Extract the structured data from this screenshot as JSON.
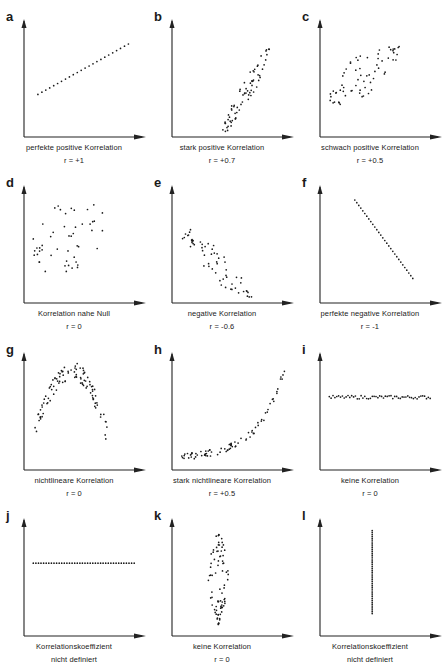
{
  "chart_data": [
    {
      "panel": "a",
      "type": "scatter",
      "title": "perfekte positive Korrelation",
      "r_label": "r = +1",
      "pattern": "line",
      "points": [
        [
          0.12,
          0.38
        ],
        [
          0.9,
          0.83
        ]
      ],
      "n": 24
    },
    {
      "panel": "b",
      "type": "scatter",
      "title": "stark positive Korrelation",
      "r_label": "r = +0.7",
      "pattern": "narrow-band",
      "from": [
        0.45,
        0.05
      ],
      "to": [
        0.85,
        0.82
      ],
      "width": 0.07,
      "n": 70
    },
    {
      "panel": "c",
      "type": "scatter",
      "title": "schwach positive Korrelation",
      "r_label": "r = +0.5",
      "pattern": "wide-band",
      "from": [
        0.08,
        0.3
      ],
      "to": [
        0.7,
        0.82
      ],
      "width": 0.17,
      "n": 65
    },
    {
      "panel": "d",
      "type": "scatter",
      "title": "Korrelation nahe Null",
      "r_label": "r = 0",
      "pattern": "cloud",
      "xrange": [
        0.08,
        0.7
      ],
      "yrange": [
        0.28,
        0.88
      ],
      "n": 50
    },
    {
      "panel": "e",
      "type": "scatter",
      "title": "negative Korrelation",
      "r_label": "r = -0.6",
      "pattern": "wide-band",
      "from": [
        0.12,
        0.62
      ],
      "to": [
        0.7,
        0.03
      ],
      "width": 0.12,
      "n": 60
    },
    {
      "panel": "f",
      "type": "scatter",
      "title": "perfekte negative Korrelation",
      "r_label": "r = -1",
      "pattern": "line",
      "points": [
        [
          0.3,
          0.92
        ],
        [
          0.8,
          0.22
        ]
      ],
      "n": 30
    },
    {
      "panel": "g",
      "type": "scatter",
      "title": "nichtlineare Korrelation",
      "r_label": "r = 0",
      "pattern": "inverted-parabola",
      "xrange": [
        0.08,
        0.72
      ],
      "peak": [
        0.42,
        0.96
      ],
      "base": 0.38,
      "n": 100
    },
    {
      "panel": "h",
      "type": "scatter",
      "title": "stark nichtlineare Korrelation",
      "r_label": "r = +0.5",
      "pattern": "exponential",
      "xrange": [
        0.08,
        0.98
      ],
      "yrange": [
        0.12,
        0.95
      ],
      "n": 80
    },
    {
      "panel": "i",
      "type": "scatter",
      "title": "keine Korrelation",
      "r_label": "r = 0",
      "pattern": "horizontal-band",
      "xrange": [
        0.08,
        0.95
      ],
      "y": 0.65,
      "n": 55
    },
    {
      "panel": "j",
      "type": "scatter",
      "title": "Korrelationskoeffizient",
      "r_label": "nicht definiert",
      "pattern": "horizontal-line",
      "xrange": [
        0.08,
        0.95
      ],
      "y": 0.65,
      "n": 40
    },
    {
      "panel": "k",
      "type": "scatter",
      "title": "keine Korrelation",
      "r_label": "r = 0",
      "pattern": "vertical-band",
      "x": 0.4,
      "yrange": [
        0.1,
        0.96
      ],
      "n": 80
    },
    {
      "panel": "l",
      "type": "scatter",
      "title": "Korrelationskoeffizient",
      "r_label": "nicht definiert",
      "pattern": "vertical-line",
      "x": 0.45,
      "yrange": [
        0.2,
        0.94
      ],
      "n": 45
    }
  ],
  "panels": [
    {
      "letter": "a",
      "caption": "perfekte positive Korrelation",
      "sub": "r = +1"
    },
    {
      "letter": "b",
      "caption": "stark positive Korrelation",
      "sub": "r = +0.7"
    },
    {
      "letter": "c",
      "caption": "schwach positive Korrelation",
      "sub": "r = +0.5"
    },
    {
      "letter": "d",
      "caption": "Korrelation nahe Null",
      "sub": "r = 0"
    },
    {
      "letter": "e",
      "caption": "negative Korrelation",
      "sub": "r = -0.6"
    },
    {
      "letter": "f",
      "caption": "perfekte negative Korrelation",
      "sub": "r = -1"
    },
    {
      "letter": "g",
      "caption": "nichtlineare Korrelation",
      "sub": "r = 0"
    },
    {
      "letter": "h",
      "caption": "stark nichtlineare Korrelation",
      "sub": "r = +0.5"
    },
    {
      "letter": "i",
      "caption": "keine Korrelation",
      "sub": "r = 0"
    },
    {
      "letter": "j",
      "caption": "Korrelationskoeffizient",
      "sub": "nicht definiert"
    },
    {
      "letter": "k",
      "caption": "keine Korrelation",
      "sub": "r = 0"
    },
    {
      "letter": "l",
      "caption": "Korrelationskoeffizient",
      "sub": "nicht definiert"
    }
  ]
}
